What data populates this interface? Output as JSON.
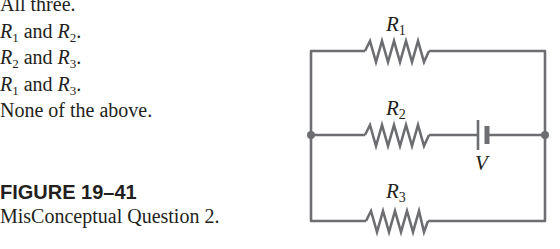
{
  "choices": [
    {
      "id": "A",
      "parts": [
        {
          "text": "All three.",
          "kind": "plain"
        }
      ]
    },
    {
      "id": "B",
      "parts": [
        {
          "var": "R",
          "sub": "1"
        },
        {
          "text": " and ",
          "kind": "plain"
        },
        {
          "var": "R",
          "sub": "2"
        },
        {
          "text": ".",
          "kind": "plain"
        }
      ]
    },
    {
      "id": "C",
      "parts": [
        {
          "var": "R",
          "sub": "2"
        },
        {
          "text": " and ",
          "kind": "plain"
        },
        {
          "var": "R",
          "sub": "3"
        },
        {
          "text": ".",
          "kind": "plain"
        }
      ]
    },
    {
      "id": "D",
      "parts": [
        {
          "var": "R",
          "sub": "1"
        },
        {
          "text": " and ",
          "kind": "plain"
        },
        {
          "var": "R",
          "sub": "3"
        },
        {
          "text": ".",
          "kind": "plain"
        }
      ]
    },
    {
      "id": "E",
      "parts": [
        {
          "text": "None of the above.",
          "kind": "plain"
        }
      ]
    }
  ],
  "figure": {
    "label": "FIGURE 19–41",
    "caption": "MisConceptual Question 2."
  },
  "circuit": {
    "resistors": [
      {
        "name": "R",
        "sub": "1",
        "branch": "top"
      },
      {
        "name": "R",
        "sub": "2",
        "branch": "middle"
      },
      {
        "name": "R",
        "sub": "3",
        "branch": "bottom"
      }
    ],
    "battery": {
      "label": "V",
      "branch": "middle"
    },
    "junctions": [
      "left",
      "right"
    ],
    "wire_color": "#6d6e71",
    "text_color": "#231f20"
  }
}
